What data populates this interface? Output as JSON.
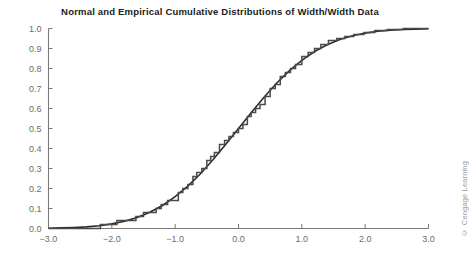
{
  "figure": {
    "title": "Normal and Empirical Cumulative Distributions of Width/Width Data",
    "credit": "© Cengage Learning",
    "background_color": "#ffffff",
    "axis_color": "#7a7a7a",
    "tick_label_color": "#6c6c6c",
    "title_color": "#1b1b1b"
  },
  "chart_data": {
    "type": "line",
    "title": "Normal and Empirical Cumulative Distributions of Width/Width Data",
    "xlabel": "",
    "ylabel": "",
    "xlim": [
      -3.0,
      3.0
    ],
    "ylim": [
      0.0,
      1.0
    ],
    "xticks": [
      "-3.0",
      "-2.0",
      "-1.0",
      "0.0",
      "1.0",
      "2.0",
      "3.0"
    ],
    "xtick_values": [
      -3.0,
      -2.0,
      -1.0,
      0.0,
      1.0,
      2.0,
      3.0
    ],
    "yticks": [
      "0.0",
      "0.1",
      "0.2",
      "0.3",
      "0.4",
      "0.5",
      "0.6",
      "0.7",
      "0.8",
      "0.9",
      "1.0"
    ],
    "ytick_values": [
      0.0,
      0.1,
      0.2,
      0.3,
      0.4,
      0.5,
      0.6,
      0.7,
      0.8,
      0.9,
      1.0
    ],
    "grid": false,
    "legend_position": "none",
    "series": [
      {
        "name": "Normal cumulative distribution",
        "style": "smooth-curve",
        "color": "#2b2b2b",
        "width": 1.6,
        "x": [
          -3.0,
          -2.8,
          -2.6,
          -2.4,
          -2.2,
          -2.0,
          -1.8,
          -1.6,
          -1.4,
          -1.2,
          -1.0,
          -0.8,
          -0.6,
          -0.4,
          -0.2,
          0.0,
          0.2,
          0.4,
          0.6,
          0.8,
          1.0,
          1.2,
          1.4,
          1.6,
          1.8,
          2.0,
          2.2,
          2.4,
          2.6,
          2.8,
          3.0
        ],
        "values": [
          0.001,
          0.003,
          0.005,
          0.008,
          0.014,
          0.023,
          0.036,
          0.055,
          0.081,
          0.115,
          0.159,
          0.212,
          0.274,
          0.345,
          0.421,
          0.5,
          0.579,
          0.655,
          0.726,
          0.788,
          0.841,
          0.885,
          0.919,
          0.945,
          0.964,
          0.977,
          0.986,
          0.992,
          0.995,
          0.997,
          0.999
        ]
      },
      {
        "name": "Empirical cumulative distribution",
        "style": "step",
        "color": "#4a4a4a",
        "width": 1.5,
        "x": [
          -3.0,
          -2.32,
          -2.18,
          -2.05,
          -1.92,
          -1.78,
          -1.62,
          -1.5,
          -1.38,
          -1.3,
          -1.22,
          -1.12,
          -1.02,
          -0.95,
          -0.88,
          -0.8,
          -0.72,
          -0.66,
          -0.58,
          -0.5,
          -0.44,
          -0.38,
          -0.3,
          -0.22,
          -0.15,
          -0.08,
          0.0,
          0.07,
          0.14,
          0.2,
          0.27,
          0.34,
          0.42,
          0.5,
          0.58,
          0.66,
          0.74,
          0.82,
          0.9,
          1.0,
          1.1,
          1.2,
          1.3,
          1.42,
          1.55,
          1.68,
          1.82,
          1.98,
          2.15,
          2.35,
          2.6,
          3.0
        ],
        "values": [
          0.0,
          0.0,
          0.02,
          0.02,
          0.04,
          0.04,
          0.06,
          0.08,
          0.08,
          0.1,
          0.12,
          0.14,
          0.14,
          0.18,
          0.2,
          0.22,
          0.26,
          0.28,
          0.3,
          0.34,
          0.36,
          0.38,
          0.42,
          0.44,
          0.46,
          0.48,
          0.5,
          0.52,
          0.56,
          0.58,
          0.6,
          0.62,
          0.66,
          0.7,
          0.72,
          0.76,
          0.78,
          0.8,
          0.82,
          0.86,
          0.88,
          0.9,
          0.92,
          0.94,
          0.95,
          0.96,
          0.97,
          0.98,
          0.99,
          0.995,
          1.0,
          1.0
        ]
      }
    ]
  }
}
